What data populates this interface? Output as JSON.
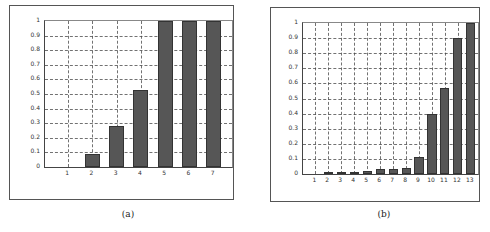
{
  "chart_data": [
    {
      "type": "bar",
      "title": "",
      "xlabel": "",
      "ylabel": "",
      "caption": "(a)",
      "categories": [
        "1",
        "2",
        "3",
        "4",
        "5",
        "6",
        "7"
      ],
      "values": [
        0,
        0.09,
        0.28,
        0.53,
        1.0,
        1.0,
        1.0
      ],
      "yticks": [
        "0",
        "0.1",
        "0.2",
        "0.3",
        "0.4",
        "0.5",
        "0.6",
        "0.7",
        "0.8",
        "0.9",
        "1"
      ],
      "ylim": [
        0,
        1
      ],
      "grid": true,
      "bar_color": "#565656"
    },
    {
      "type": "bar",
      "title": "",
      "xlabel": "",
      "ylabel": "",
      "caption": "(b)",
      "categories": [
        "1",
        "2",
        "3",
        "4",
        "5",
        "6",
        "7",
        "8",
        "9",
        "10",
        "11",
        "12",
        "13"
      ],
      "values": [
        0,
        0.01,
        0.01,
        0.01,
        0.02,
        0.03,
        0.035,
        0.04,
        0.11,
        0.4,
        0.57,
        0.9,
        1.0
      ],
      "yticks": [
        "0",
        "0.1",
        "0.2",
        "0.3",
        "0.4",
        "0.5",
        "0.6",
        "0.7",
        "0.8",
        "0.9",
        "1"
      ],
      "ylim": [
        0,
        1
      ],
      "grid": true,
      "bar_color": "#565656"
    }
  ]
}
